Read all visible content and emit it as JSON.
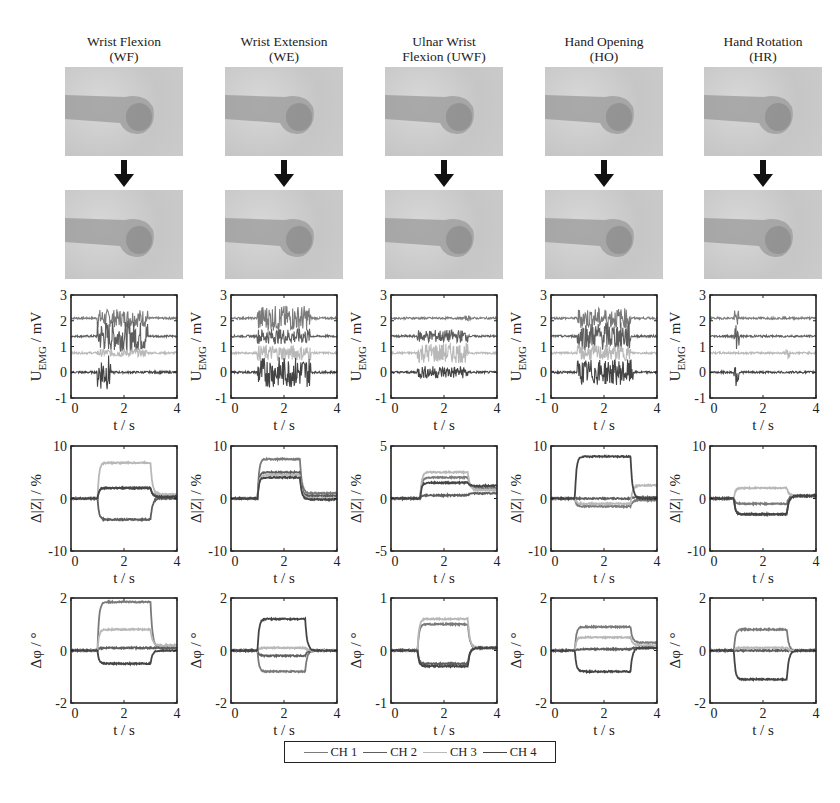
{
  "columns": [
    {
      "id": "wf",
      "title_line1": "Wrist Flexion",
      "title_line2": "(WF)"
    },
    {
      "id": "we",
      "title_line1": "Wrist Extension",
      "title_line2": "(WE)"
    },
    {
      "id": "uwf",
      "title_line1": "Ulnar Wrist",
      "title_line2": "Flexion (UWF)"
    },
    {
      "id": "ho",
      "title_line1": "Hand Opening",
      "title_line2": "(HO)"
    },
    {
      "id": "hr",
      "title_line1": "Hand Rotation",
      "title_line2": "(HR)"
    }
  ],
  "legend": {
    "items": [
      {
        "label": "CH 1",
        "color": "#7a7a7a"
      },
      {
        "label": "CH 2",
        "color": "#5e5e5e"
      },
      {
        "label": "CH 3",
        "color": "#b8b8b8"
      },
      {
        "label": "CH 4",
        "color": "#444444"
      }
    ]
  },
  "axis_labels": {
    "emg_y": "U_EMG / mV",
    "z_y": "Δ|Z| / %",
    "phi_y": "Δφ / °",
    "x": "t / s"
  },
  "chart_data": [
    {
      "type": "line",
      "row": "EMG",
      "column": "Wrist Flexion (WF)",
      "xlabel": "t / s",
      "ylabel": "U_EMG / mV",
      "xlim": [
        0,
        4
      ],
      "ylim": [
        -1,
        3
      ],
      "xticks": [
        0,
        2,
        4
      ],
      "yticks": [
        -1,
        0,
        1,
        2,
        3
      ],
      "series": [
        {
          "name": "CH 1",
          "offset": 2.1,
          "active": [
            1.0,
            2.9
          ],
          "amp": 0.35
        },
        {
          "name": "CH 2",
          "offset": 1.4,
          "active": [
            1.0,
            2.9
          ],
          "amp": 0.6
        },
        {
          "name": "CH 3",
          "offset": 0.75,
          "active": [
            1.0,
            2.9
          ],
          "amp": 0.15
        },
        {
          "name": "CH 4",
          "offset": 0.0,
          "active": [
            1.0,
            1.5
          ],
          "amp": 0.7
        }
      ]
    },
    {
      "type": "line",
      "row": "EMG",
      "column": "Wrist Extension (WE)",
      "xlabel": "t / s",
      "ylabel": "U_EMG / mV",
      "xlim": [
        0,
        4
      ],
      "ylim": [
        -1,
        3
      ],
      "xticks": [
        0,
        2,
        4
      ],
      "yticks": [
        -1,
        0,
        1,
        2,
        3
      ],
      "series": [
        {
          "name": "CH 1",
          "offset": 2.1,
          "active": [
            1.0,
            3.0
          ],
          "amp": 0.5
        },
        {
          "name": "CH 2",
          "offset": 1.4,
          "active": [
            1.0,
            3.0
          ],
          "amp": 0.3
        },
        {
          "name": "CH 3",
          "offset": 0.75,
          "active": [
            1.0,
            3.0
          ],
          "amp": 0.3
        },
        {
          "name": "CH 4",
          "offset": 0.0,
          "active": [
            1.0,
            3.0
          ],
          "amp": 0.6
        }
      ]
    },
    {
      "type": "line",
      "row": "EMG",
      "column": "Ulnar Wrist Flexion (UWF)",
      "xlabel": "t / s",
      "ylabel": "U_EMG / mV",
      "xlim": [
        0,
        4
      ],
      "ylim": [
        -1,
        3
      ],
      "xticks": [
        0,
        2,
        4
      ],
      "yticks": [
        -1,
        0,
        1,
        2,
        3
      ],
      "series": [
        {
          "name": "CH 1",
          "offset": 2.1,
          "active": [
            2.8,
            3.0
          ],
          "amp": 0.1
        },
        {
          "name": "CH 2",
          "offset": 1.4,
          "active": [
            1.0,
            2.9
          ],
          "amp": 0.25
        },
        {
          "name": "CH 3",
          "offset": 0.75,
          "active": [
            1.0,
            2.9
          ],
          "amp": 0.4
        },
        {
          "name": "CH 4",
          "offset": 0.0,
          "active": [
            1.0,
            2.9
          ],
          "amp": 0.25
        }
      ]
    },
    {
      "type": "line",
      "row": "EMG",
      "column": "Hand Opening (HO)",
      "xlabel": "t / s",
      "ylabel": "U_EMG / mV",
      "xlim": [
        0,
        4
      ],
      "ylim": [
        -1,
        3
      ],
      "xticks": [
        0,
        2,
        4
      ],
      "yticks": [
        -1,
        0,
        1,
        2,
        3
      ],
      "series": [
        {
          "name": "CH 1",
          "offset": 2.1,
          "active": [
            1.0,
            3.0
          ],
          "amp": 0.4
        },
        {
          "name": "CH 2",
          "offset": 1.4,
          "active": [
            1.0,
            3.0
          ],
          "amp": 0.55
        },
        {
          "name": "CH 3",
          "offset": 0.75,
          "active": [
            1.0,
            3.0
          ],
          "amp": 0.3
        },
        {
          "name": "CH 4",
          "offset": 0.0,
          "active": [
            1.0,
            3.1
          ],
          "amp": 0.5
        }
      ]
    },
    {
      "type": "line",
      "row": "EMG",
      "column": "Hand Rotation (HR)",
      "xlabel": "t / s",
      "ylabel": "U_EMG / mV",
      "xlim": [
        0,
        4
      ],
      "ylim": [
        -1,
        3
      ],
      "xticks": [
        0,
        2,
        4
      ],
      "yticks": [
        -1,
        0,
        1,
        2,
        3
      ],
      "series": [
        {
          "name": "CH 1",
          "offset": 2.1,
          "active": [
            0.9,
            1.1
          ],
          "amp": 0.3
        },
        {
          "name": "CH 2",
          "offset": 1.4,
          "active": [
            0.9,
            1.1
          ],
          "amp": 0.5
        },
        {
          "name": "CH 3",
          "offset": 0.75,
          "active": [
            2.8,
            3.0
          ],
          "amp": 0.2
        },
        {
          "name": "CH 4",
          "offset": 0.0,
          "active": [
            0.9,
            1.1
          ],
          "amp": 0.6
        }
      ]
    },
    {
      "type": "line",
      "row": "Impedance",
      "column": "Wrist Flexion (WF)",
      "xlabel": "t / s",
      "ylabel": "Δ|Z| / %",
      "xlim": [
        0,
        4
      ],
      "ylim": [
        -10,
        10
      ],
      "xticks": [
        0,
        2,
        4
      ],
      "yticks": [
        -10,
        0,
        10
      ],
      "series": [
        {
          "name": "CH 1",
          "plateau": 2.0,
          "after": 0.5
        },
        {
          "name": "CH 2",
          "plateau": -4.0,
          "after": 0.0
        },
        {
          "name": "CH 3",
          "plateau": 6.8,
          "after": 0.8
        },
        {
          "name": "CH 4",
          "plateau": 2.0,
          "after": 0.3
        }
      ],
      "on": 1.0,
      "off": 3.0
    },
    {
      "type": "line",
      "row": "Impedance",
      "column": "Wrist Extension (WE)",
      "xlabel": "t / s",
      "ylabel": "Δ|Z| / %",
      "xlim": [
        0,
        4
      ],
      "ylim": [
        -10,
        10
      ],
      "xticks": [
        0,
        2,
        4
      ],
      "yticks": [
        -10,
        0,
        10
      ],
      "series": [
        {
          "name": "CH 1",
          "plateau": 7.5,
          "after": 1.0
        },
        {
          "name": "CH 2",
          "plateau": 5.0,
          "after": 0.5
        },
        {
          "name": "CH 3",
          "plateau": 4.5,
          "after": 0.0
        },
        {
          "name": "CH 4",
          "plateau": 4.0,
          "after": -0.2
        }
      ],
      "on": 1.0,
      "off": 2.6
    },
    {
      "type": "line",
      "row": "Impedance",
      "column": "Ulnar Wrist Flexion (UWF)",
      "xlabel": "t / s",
      "ylabel": "Δ|Z| / %",
      "xlim": [
        0,
        4
      ],
      "ylim": [
        -5,
        5
      ],
      "xticks": [
        0,
        2,
        4
      ],
      "yticks": [
        -5,
        0,
        5
      ],
      "series": [
        {
          "name": "CH 1",
          "plateau": 2.0,
          "after": 1.0
        },
        {
          "name": "CH 2",
          "plateau": 0.3,
          "after": 0.5
        },
        {
          "name": "CH 3",
          "plateau": 2.5,
          "after": 0.8
        },
        {
          "name": "CH 4",
          "plateau": 1.5,
          "after": 1.2
        }
      ],
      "on": 1.1,
      "off": 2.9
    },
    {
      "type": "line",
      "row": "Impedance",
      "column": "Hand Opening (HO)",
      "xlabel": "t / s",
      "ylabel": "Δ|Z| / %",
      "xlim": [
        0,
        4
      ],
      "ylim": [
        -10,
        10
      ],
      "xticks": [
        0,
        2,
        4
      ],
      "yticks": [
        -10,
        0,
        10
      ],
      "series": [
        {
          "name": "CH 1",
          "plateau": -1.5,
          "after": -0.3
        },
        {
          "name": "CH 2",
          "plateau": 0.0,
          "after": 0.2
        },
        {
          "name": "CH 3",
          "plateau": -1.0,
          "after": 2.5
        },
        {
          "name": "CH 4",
          "plateau": 8.0,
          "after": 0.0
        }
      ],
      "on": 0.9,
      "off": 3.0
    },
    {
      "type": "line",
      "row": "Impedance",
      "column": "Hand Rotation (HR)",
      "xlabel": "t / s",
      "ylabel": "Δ|Z| / %",
      "xlim": [
        0,
        4
      ],
      "ylim": [
        -10,
        10
      ],
      "xticks": [
        0,
        2,
        4
      ],
      "yticks": [
        -10,
        0,
        10
      ],
      "series": [
        {
          "name": "CH 1",
          "plateau": -1.0,
          "after": 0.5
        },
        {
          "name": "CH 2",
          "plateau": -3.0,
          "after": 0.5
        },
        {
          "name": "CH 3",
          "plateau": 2.0,
          "after": 0.5
        },
        {
          "name": "CH 4",
          "plateau": -3.0,
          "after": 0.5
        }
      ],
      "on": 0.9,
      "off": 2.9
    },
    {
      "type": "line",
      "row": "Phase",
      "column": "Wrist Flexion (WF)",
      "xlabel": "t / s",
      "ylabel": "Δφ / °",
      "xlim": [
        0,
        4
      ],
      "ylim": [
        -2,
        2
      ],
      "xticks": [
        0,
        2,
        4
      ],
      "yticks": [
        -2,
        0,
        2
      ],
      "series": [
        {
          "name": "CH 1",
          "plateau": 1.85,
          "after": 0.1
        },
        {
          "name": "CH 2",
          "plateau": 0.1,
          "after": 0.1
        },
        {
          "name": "CH 3",
          "plateau": 0.8,
          "after": 0.2
        },
        {
          "name": "CH 4",
          "plateau": -0.5,
          "after": 0.0
        }
      ],
      "on": 1.0,
      "off": 3.0
    },
    {
      "type": "line",
      "row": "Phase",
      "column": "Wrist Extension (WE)",
      "xlabel": "t / s",
      "ylabel": "Δφ / °",
      "xlim": [
        0,
        4
      ],
      "ylim": [
        -2,
        2
      ],
      "xticks": [
        0,
        2,
        4
      ],
      "yticks": [
        -2,
        0,
        2
      ],
      "series": [
        {
          "name": "CH 1",
          "plateau": -0.8,
          "after": 0.0
        },
        {
          "name": "CH 2",
          "plateau": -0.2,
          "after": 0.0
        },
        {
          "name": "CH 3",
          "plateau": 0.1,
          "after": 0.0
        },
        {
          "name": "CH 4",
          "plateau": 1.2,
          "after": 0.0
        }
      ],
      "on": 1.0,
      "off": 2.8
    },
    {
      "type": "line",
      "row": "Phase",
      "column": "Ulnar Wrist Flexion (UWF)",
      "xlabel": "t / s",
      "ylabel": "Δφ / °",
      "xlim": [
        0,
        4
      ],
      "ylim": [
        -1,
        1
      ],
      "xticks": [
        0,
        2,
        4
      ],
      "yticks": [
        -1,
        0,
        1
      ],
      "series": [
        {
          "name": "CH 1",
          "plateau": 0.5,
          "after": 0.05
        },
        {
          "name": "CH 2",
          "plateau": -0.25,
          "after": 0.05
        },
        {
          "name": "CH 3",
          "plateau": 0.6,
          "after": 0.05
        },
        {
          "name": "CH 4",
          "plateau": -0.3,
          "after": 0.05
        }
      ],
      "on": 1.0,
      "off": 2.9
    },
    {
      "type": "line",
      "row": "Phase",
      "column": "Hand Opening (HO)",
      "xlabel": "t / s",
      "ylabel": "Δφ / °",
      "xlim": [
        0,
        4
      ],
      "ylim": [
        -2,
        2
      ],
      "xticks": [
        0,
        2,
        4
      ],
      "yticks": [
        -2,
        0,
        2
      ],
      "series": [
        {
          "name": "CH 1",
          "plateau": 0.9,
          "after": 0.3
        },
        {
          "name": "CH 2",
          "plateau": 0.05,
          "after": 0.1
        },
        {
          "name": "CH 3",
          "plateau": 0.5,
          "after": 0.2
        },
        {
          "name": "CH 4",
          "plateau": -0.8,
          "after": 0.1
        }
      ],
      "on": 0.9,
      "off": 3.0
    },
    {
      "type": "line",
      "row": "Phase",
      "column": "Hand Rotation (HR)",
      "xlabel": "t / s",
      "ylabel": "Δφ / °",
      "xlim": [
        0,
        4
      ],
      "ylim": [
        -2,
        2
      ],
      "xticks": [
        0,
        2,
        4
      ],
      "yticks": [
        -2,
        0,
        2
      ],
      "series": [
        {
          "name": "CH 1",
          "plateau": 0.8,
          "after": 0.0
        },
        {
          "name": "CH 2",
          "plateau": 0.0,
          "after": 0.0
        },
        {
          "name": "CH 3",
          "plateau": 0.1,
          "after": 0.0
        },
        {
          "name": "CH 4",
          "plateau": -1.1,
          "after": 0.0
        }
      ],
      "on": 0.9,
      "off": 2.9
    }
  ]
}
